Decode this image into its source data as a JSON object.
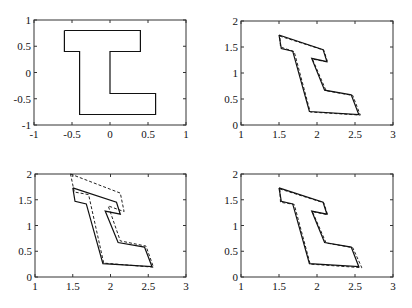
{
  "chart_data": [
    {
      "type": "line",
      "panel": "top-left",
      "title": "",
      "xlabel": "",
      "ylabel": "",
      "xlim": [
        -1,
        1
      ],
      "ylim": [
        -1,
        1
      ],
      "xticks": [
        "-1",
        "-0.5",
        "0",
        "0.5",
        "1"
      ],
      "yticks": [
        "1",
        "0.5",
        "0",
        "-0.5",
        "-1"
      ],
      "grid": false,
      "series": [
        {
          "name": "original shape",
          "style": "solid",
          "x": [
            -0.6,
            0.4,
            0.4,
            0.0,
            0.0,
            0.6,
            0.6,
            -0.4,
            -0.4,
            -0.6,
            -0.6
          ],
          "y": [
            0.8,
            0.8,
            0.4,
            0.4,
            -0.4,
            -0.4,
            -0.8,
            -0.8,
            0.4,
            0.4,
            0.8
          ]
        }
      ]
    },
    {
      "type": "line",
      "panel": "top-right",
      "xlim": [
        1,
        3
      ],
      "ylim": [
        0,
        2
      ],
      "xticks": [
        "1",
        "1.5",
        "2",
        "2.5",
        "3"
      ],
      "yticks": [
        "2",
        "1.5",
        "1",
        "0.5",
        "0"
      ],
      "grid": false,
      "series": [
        {
          "name": "target",
          "style": "solid",
          "x": [
            1.5,
            2.08,
            2.13,
            1.93,
            2.1,
            2.45,
            2.55,
            1.9,
            1.68,
            1.53,
            1.5
          ],
          "y": [
            1.73,
            1.45,
            1.22,
            1.28,
            0.67,
            0.58,
            0.2,
            0.26,
            1.42,
            1.47,
            1.73
          ]
        },
        {
          "name": "estimate",
          "style": "dashed",
          "x": [
            1.51,
            2.09,
            2.14,
            1.94,
            2.12,
            2.47,
            2.57,
            1.91,
            1.7,
            1.52,
            1.51
          ],
          "y": [
            1.71,
            1.44,
            1.21,
            1.27,
            0.66,
            0.57,
            0.19,
            0.25,
            1.41,
            1.5,
            1.71
          ]
        }
      ]
    },
    {
      "type": "line",
      "panel": "bottom-left",
      "xlim": [
        1,
        3
      ],
      "ylim": [
        0,
        2
      ],
      "xticks": [
        "1",
        "1.5",
        "2",
        "2.5",
        "3"
      ],
      "yticks": [
        "2",
        "1.5",
        "1",
        "0.5",
        "0"
      ],
      "grid": false,
      "series": [
        {
          "name": "target",
          "style": "solid",
          "x": [
            1.5,
            2.08,
            2.13,
            1.93,
            2.1,
            2.45,
            2.55,
            1.9,
            1.68,
            1.53,
            1.5
          ],
          "y": [
            1.73,
            1.45,
            1.22,
            1.28,
            0.67,
            0.58,
            0.2,
            0.26,
            1.42,
            1.47,
            1.73
          ]
        },
        {
          "name": "estimate",
          "style": "dashed",
          "x": [
            1.47,
            2.13,
            2.18,
            1.97,
            2.13,
            2.47,
            2.57,
            1.91,
            1.71,
            1.52,
            1.47
          ],
          "y": [
            2.0,
            1.63,
            1.27,
            1.38,
            0.7,
            0.6,
            0.19,
            0.27,
            1.6,
            1.65,
            2.0
          ]
        }
      ]
    },
    {
      "type": "line",
      "panel": "bottom-right",
      "xlim": [
        1,
        3
      ],
      "ylim": [
        0,
        2
      ],
      "xticks": [
        "1",
        "1.5",
        "2",
        "2.5",
        "3"
      ],
      "yticks": [
        "2",
        "1.5",
        "1",
        "0.5",
        "0"
      ],
      "grid": false,
      "series": [
        {
          "name": "target",
          "style": "solid",
          "x": [
            1.5,
            2.08,
            2.13,
            1.93,
            2.1,
            2.45,
            2.55,
            1.9,
            1.68,
            1.53,
            1.5
          ],
          "y": [
            1.73,
            1.45,
            1.22,
            1.28,
            0.67,
            0.58,
            0.2,
            0.26,
            1.42,
            1.47,
            1.73
          ]
        },
        {
          "name": "estimate",
          "style": "dashed",
          "x": [
            1.51,
            2.09,
            2.14,
            1.94,
            2.12,
            2.47,
            2.59,
            1.91,
            1.7,
            1.52,
            1.51
          ],
          "y": [
            1.71,
            1.44,
            1.21,
            1.27,
            0.66,
            0.57,
            0.18,
            0.25,
            1.41,
            1.45,
            1.71
          ]
        }
      ]
    }
  ],
  "panels": [
    {
      "id": "top-left",
      "box": [
        34,
        20,
        186,
        125
      ]
    },
    {
      "id": "top-right",
      "box": [
        241,
        21,
        393,
        125
      ]
    },
    {
      "id": "bottom-left",
      "box": [
        35,
        174,
        186,
        277
      ]
    },
    {
      "id": "bottom-right",
      "box": [
        241,
        174,
        393,
        277
      ]
    }
  ]
}
